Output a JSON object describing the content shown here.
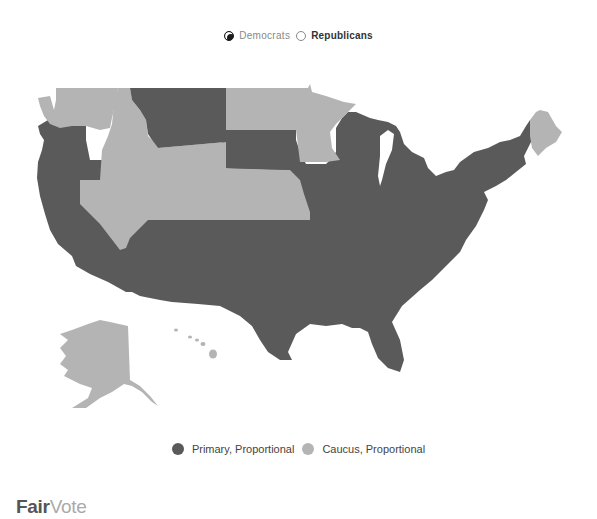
{
  "top_legend": {
    "options": [
      {
        "label": "Democrats",
        "selected": true
      },
      {
        "label": "Republicans",
        "selected": false
      }
    ]
  },
  "colors": {
    "primary": "#5a5a5a",
    "caucus": "#b4b4b4",
    "background": "#ffffff"
  },
  "map": {
    "title": "U.S. States by Democratic delegate allocation method",
    "categories": [
      {
        "name": "Primary, Proportional",
        "color": "#5a5a5a"
      },
      {
        "name": "Caucus, Proportional",
        "color": "#b4b4b4"
      }
    ],
    "caucus_states": [
      "Washington",
      "Idaho",
      "Nevada",
      "Utah",
      "Colorado",
      "Wyoming",
      "Nebraska",
      "Kansas",
      "North Dakota",
      "Minnesota",
      "Maine",
      "Alaska",
      "Hawaii"
    ],
    "primary_states": [
      "Oregon",
      "California",
      "Montana",
      "South Dakota",
      "Arizona",
      "New Mexico",
      "Texas",
      "Oklahoma",
      "Iowa",
      "Missouri",
      "Arkansas",
      "Louisiana",
      "Wisconsin",
      "Illinois",
      "Michigan",
      "Indiana",
      "Ohio",
      "Kentucky",
      "Tennessee",
      "Mississippi",
      "Alabama",
      "Georgia",
      "Florida",
      "South Carolina",
      "North Carolina",
      "Virginia",
      "West Virginia",
      "Pennsylvania",
      "New York",
      "New Jersey",
      "Delaware",
      "Maryland",
      "Vermont",
      "New Hampshire",
      "Massachusetts",
      "Connecticut",
      "Rhode Island"
    ]
  },
  "bottom_legend": {
    "items": [
      {
        "label": "Primary, Proportional",
        "color": "#5a5a5a"
      },
      {
        "label": "Caucus, Proportional",
        "color": "#b4b4b4"
      }
    ]
  },
  "logo": {
    "part1": "Fair",
    "part2": "Vote"
  }
}
